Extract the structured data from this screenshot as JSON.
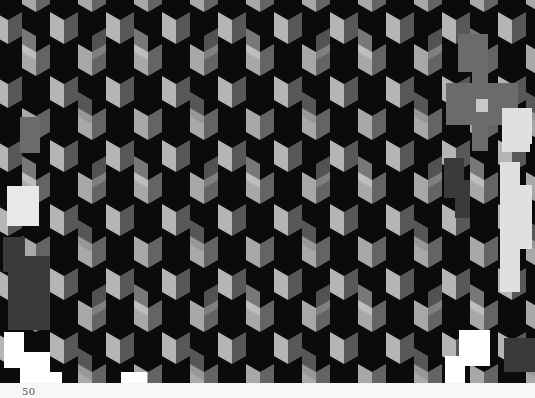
{
  "figure": {
    "pattern": "cube",
    "colors": {
      "dark_face": "#0b0b0b",
      "light_face": "#b8b8b8",
      "mid_face": "#5c5c5c",
      "background": "#f7f7f7"
    }
  },
  "page": {
    "number": "50"
  }
}
